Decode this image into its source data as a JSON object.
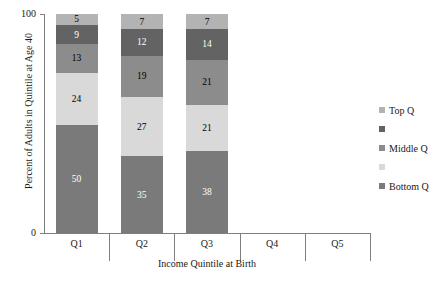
{
  "chart_data": {
    "type": "bar",
    "variant": "stacked-100",
    "title": "",
    "xlabel": "Income Quintile at Birth",
    "ylabel": "Percent of Adults in Quintile at Age 40",
    "categories": [
      "Q1",
      "Q2",
      "Q3",
      "Q4",
      "Q5"
    ],
    "ylim": [
      0,
      100
    ],
    "yticks": [
      0,
      100
    ],
    "ytick_labels": [
      "0",
      "100"
    ],
    "grid": false,
    "legend_position": "right",
    "series": [
      {
        "name": "Bottom Q",
        "color": "#7a7a7a",
        "values": [
          50,
          35,
          38,
          null,
          null
        ],
        "labels": [
          "50",
          "35",
          "38",
          "",
          ""
        ]
      },
      {
        "name": "",
        "color": "#d9d9d9",
        "values": [
          24,
          27,
          21,
          null,
          null
        ],
        "labels": [
          "24",
          "27",
          "21",
          "",
          ""
        ]
      },
      {
        "name": "Middle Q",
        "color": "#8c8c8c",
        "values": [
          13,
          19,
          21,
          null,
          null
        ],
        "labels": [
          "13",
          "19",
          "21",
          "",
          ""
        ]
      },
      {
        "name": "",
        "color": "#636363",
        "values": [
          9,
          12,
          14,
          null,
          null
        ],
        "labels": [
          "9",
          "12",
          "14",
          "",
          ""
        ]
      },
      {
        "name": "Top Q",
        "color": "#b3b3b3",
        "values": [
          5,
          7,
          7,
          null,
          null
        ],
        "labels": [
          "5",
          "7",
          "7",
          "",
          ""
        ]
      }
    ]
  },
  "axes": {
    "y_title": "Percent of Adults in Quintile at Age 40",
    "x_title": "Income Quintile at Birth",
    "y_tick_top": "100",
    "y_tick_bottom": "0"
  },
  "categories": [
    {
      "label": "Q1"
    },
    {
      "label": "Q2"
    },
    {
      "label": "Q3"
    },
    {
      "label": "Q4"
    },
    {
      "label": "Q5"
    }
  ],
  "bars": [
    {
      "category": "Q1",
      "segments": [
        {
          "label": "50",
          "value": 50,
          "color": "#7a7a7a",
          "dark": true
        },
        {
          "label": "24",
          "value": 24,
          "color": "#d9d9d9",
          "dark": false
        },
        {
          "label": "13",
          "value": 13,
          "color": "#8c8c8c",
          "dark": false
        },
        {
          "label": "9",
          "value": 9,
          "color": "#636363",
          "dark": true
        },
        {
          "label": "5",
          "value": 5,
          "color": "#b3b3b3",
          "dark": false
        }
      ]
    },
    {
      "category": "Q2",
      "segments": [
        {
          "label": "35",
          "value": 35,
          "color": "#7a7a7a",
          "dark": true
        },
        {
          "label": "27",
          "value": 27,
          "color": "#d9d9d9",
          "dark": false
        },
        {
          "label": "19",
          "value": 19,
          "color": "#8c8c8c",
          "dark": false
        },
        {
          "label": "12",
          "value": 12,
          "color": "#636363",
          "dark": true
        },
        {
          "label": "7",
          "value": 7,
          "color": "#b3b3b3",
          "dark": false
        }
      ]
    },
    {
      "category": "Q3",
      "segments": [
        {
          "label": "38",
          "value": 38,
          "color": "#7a7a7a",
          "dark": true
        },
        {
          "label": "21",
          "value": 21,
          "color": "#d9d9d9",
          "dark": false
        },
        {
          "label": "21",
          "value": 21,
          "color": "#8c8c8c",
          "dark": false
        },
        {
          "label": "14",
          "value": 14,
          "color": "#636363",
          "dark": true
        },
        {
          "label": "7",
          "value": 7,
          "color": "#b3b3b3",
          "dark": false
        }
      ]
    },
    {
      "category": "Q4",
      "segments": []
    },
    {
      "category": "Q5",
      "segments": []
    }
  ],
  "legend": {
    "items": [
      {
        "label": "Top Q",
        "color": "#b3b3b3"
      },
      {
        "label": "",
        "color": "#636363"
      },
      {
        "label": "Middle Q",
        "color": "#8c8c8c"
      },
      {
        "label": "",
        "color": "#d9d9d9"
      },
      {
        "label": "Bottom Q",
        "color": "#7a7a7a"
      }
    ]
  }
}
